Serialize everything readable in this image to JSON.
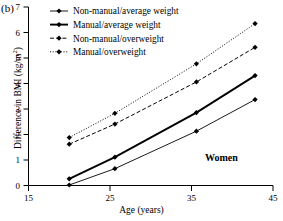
{
  "panel": {
    "label": "(b)"
  },
  "annotation": {
    "text": "Women"
  },
  "axes": {
    "ylabel_main": "Difference in BMI (kg/m",
    "ylabel_sup": "2",
    "ylabel_close": ")",
    "xlabel": "Age (years)",
    "xticks": [
      "15",
      "25",
      "35",
      "45"
    ],
    "yticks": [
      "0",
      "1",
      "2",
      "3",
      "4",
      "5",
      "6",
      "7"
    ]
  },
  "legend": {
    "items": [
      {
        "label": "Non-manual/average weight",
        "style": "solid-thin"
      },
      {
        "label": "Manual/average weight",
        "style": "solid-thick"
      },
      {
        "label": "Non-manual/overweight",
        "style": "dashed"
      },
      {
        "label": "Manual/overweight",
        "style": "dotted"
      }
    ]
  },
  "chart_data": {
    "type": "line",
    "title": "",
    "subtitle": "",
    "xlabel": "Age (years)",
    "ylabel": "Difference in BMI (kg/m2)",
    "xlim": [
      15,
      45
    ],
    "ylim": [
      0,
      7
    ],
    "xticks": [
      15,
      25,
      35,
      45
    ],
    "yticks": [
      0,
      1,
      2,
      3,
      4,
      5,
      6,
      7
    ],
    "grid": false,
    "legend_position": "top-left",
    "marker": "diamond",
    "x": [
      20.0,
      25.6,
      35.6,
      42.8
    ],
    "series": [
      {
        "name": "Non-manual/average weight",
        "style": "solid-thin",
        "values": [
          0.02,
          0.66,
          2.13,
          3.37
        ]
      },
      {
        "name": "Manual/average weight",
        "style": "solid-thick",
        "values": [
          0.26,
          1.11,
          2.86,
          4.31
        ]
      },
      {
        "name": "Non-manual/overweight",
        "style": "dashed",
        "values": [
          1.62,
          2.41,
          4.06,
          5.42
        ]
      },
      {
        "name": "Manual/overweight",
        "style": "dotted",
        "values": [
          1.88,
          2.83,
          4.77,
          6.35
        ]
      }
    ],
    "annotations": [
      {
        "text": "Women",
        "x": 37.5,
        "y": 1.0
      }
    ]
  },
  "colors": {
    "ink": "#000000",
    "background": "#ffffff"
  }
}
